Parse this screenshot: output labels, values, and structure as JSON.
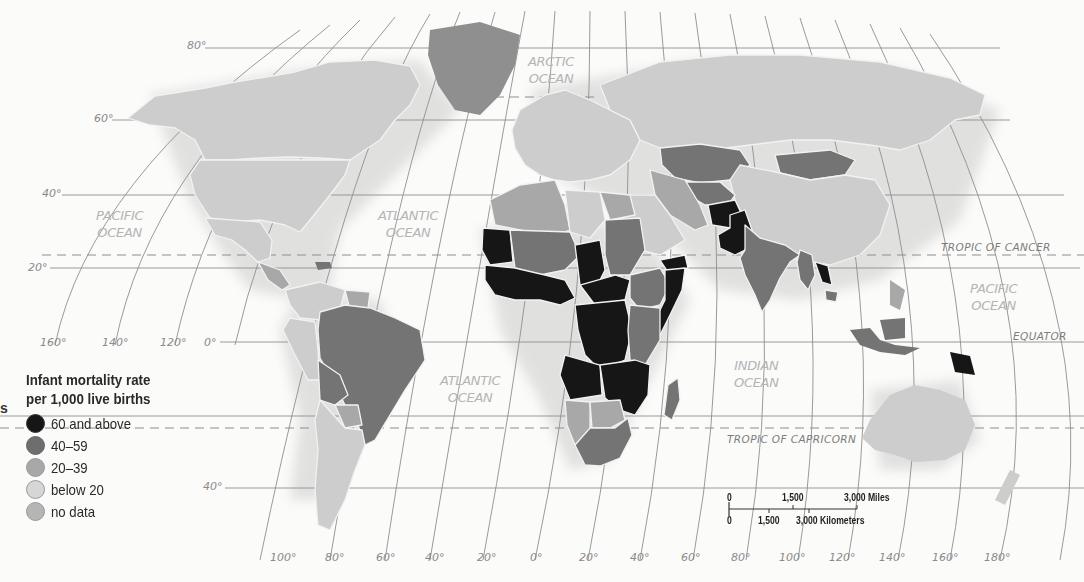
{
  "map": {
    "title": "Infant mortality rate per 1,000 live births",
    "projection": "Robinson-like world projection",
    "oceans": [
      {
        "id": "arctic",
        "line1": "ARCTIC",
        "line2": "OCEAN"
      },
      {
        "id": "pacific_west",
        "line1": "PACIFIC",
        "line2": "OCEAN"
      },
      {
        "id": "atlantic_north",
        "line1": "ATLANTIC",
        "line2": "OCEAN"
      },
      {
        "id": "atlantic_south",
        "line1": "ATLANTIC",
        "line2": "OCEAN"
      },
      {
        "id": "indian",
        "line1": "INDIAN",
        "line2": "OCEAN"
      },
      {
        "id": "pacific_east",
        "line1": "PACIFIC",
        "line2": "OCEAN"
      }
    ],
    "reference_lines": {
      "tropic_cancer": "TROPIC OF CANCER",
      "equator": "EQUATOR",
      "tropic_capricorn": "TROPIC OF CAPRICORN"
    },
    "latitude_labels": [
      "80°",
      "60°",
      "40°",
      "20°",
      "0°",
      "40°"
    ],
    "longitude_labels_left": [
      "160°",
      "140°",
      "120°"
    ],
    "longitude_labels_bottom": [
      "100°",
      "80°",
      "60°",
      "40°",
      "20°",
      "0°",
      "20°",
      "40°",
      "60°",
      "80°",
      "100°",
      "120°",
      "140°",
      "160°",
      "180°"
    ],
    "edge_fragment": "s",
    "legend": {
      "title_line1": "Infant mortality rate",
      "title_line2": "per 1,000 live births",
      "items": [
        {
          "label": "60 and above",
          "color": "#161616"
        },
        {
          "label": "40–59",
          "color": "#6e6e6e"
        },
        {
          "label": "20–39",
          "color": "#a8a8a8"
        },
        {
          "label": "below 20",
          "color": "#d6d6d6"
        },
        {
          "label": "no data",
          "color": "#b5b5b5"
        }
      ]
    },
    "scale": {
      "miles": [
        "0",
        "1,500",
        "3,000 Miles"
      ],
      "kilometers": [
        "0",
        "1,500",
        "3,000 Kilometers"
      ]
    },
    "classes": {
      "60_and_above": [
        "Mauritania",
        "Mali-west Africa",
        "Chad",
        "Niger region",
        "Central Africa",
        "DR Congo",
        "Angola",
        "Mozambique",
        "Somalia",
        "Yemen",
        "Afghanistan",
        "Pakistan",
        "Laos",
        "Papua New Guinea"
      ],
      "40_59": [
        "Sudan",
        "Ethiopia",
        "Kenya",
        "Tanzania",
        "Madagascar",
        "South Africa",
        "India",
        "Myanmar",
        "Bangladesh",
        "Kazakhstan",
        "Mongolia",
        "Turkmenistan",
        "Brazil",
        "Bolivia",
        "Indonesia",
        "Greenland"
      ],
      "20_39": [
        "Algeria",
        "Morocco",
        "Egypt",
        "Namibia",
        "Botswana",
        "Zimbabwe",
        "Iraq",
        "Peru",
        "Paraguay"
      ],
      "below_20": [
        "United States",
        "Canada",
        "Mexico",
        "Europe",
        "Russia",
        "China",
        "Australia",
        "Argentina",
        "Chile",
        "Libya",
        "Saudi Arabia"
      ]
    }
  }
}
